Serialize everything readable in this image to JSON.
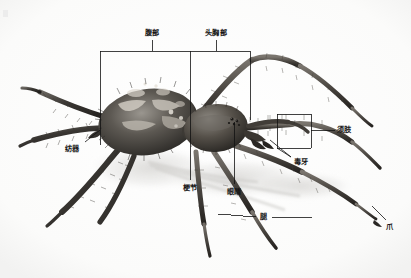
{
  "figure": {
    "style": "grayscale photograph with Chinese annotation labels",
    "width": 411,
    "height": 278,
    "background_color": "#fefefe",
    "line_color": "#111111",
    "label_color": "#161616"
  },
  "labels": {
    "abdomen": "腹部",
    "cephalothorax": "头胸部",
    "spinneret": "纺器",
    "pedipalp": "须肢",
    "fang": "毒牙",
    "pedicel": "梗节",
    "eyes": "眼睛",
    "leg": "腿",
    "claw": "爪"
  },
  "annotations": [
    {
      "id": "abdomen",
      "text": "腹部",
      "x": 152,
      "y": 32,
      "connector": "bracket-top-left"
    },
    {
      "id": "cephalothorax",
      "text": "头胸部",
      "x": 216,
      "y": 32,
      "connector": "bracket-top-right"
    },
    {
      "id": "spinneret",
      "text": "纺器",
      "x": 78,
      "y": 148,
      "connector": "diagonal-up-right"
    },
    {
      "id": "pedipalp",
      "text": "须肢",
      "x": 341,
      "y": 129,
      "connector": "box-left"
    },
    {
      "id": "fang",
      "text": "毒牙",
      "x": 297,
      "y": 161,
      "connector": "diagonal-up-left"
    },
    {
      "id": "pedicel",
      "text": "梗节",
      "x": 188,
      "y": 186,
      "connector": "vertical-up"
    },
    {
      "id": "eyes",
      "text": "眼睛",
      "x": 238,
      "y": 192,
      "connector": "vertical-up"
    },
    {
      "id": "leg",
      "text": "腿",
      "x": 263,
      "y": 219,
      "connector": "horizontal-both"
    },
    {
      "id": "claw",
      "text": "爪",
      "x": 390,
      "y": 228,
      "connector": "diagonal-up-left"
    }
  ]
}
